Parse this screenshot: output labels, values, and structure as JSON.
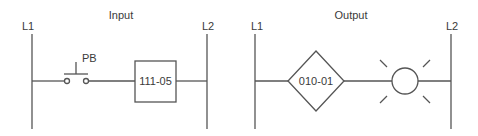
{
  "diagram": {
    "type": "ladder-logic",
    "colors": {
      "line": "#555555",
      "text": "#3a3a3a",
      "background": "#ffffff"
    },
    "input": {
      "title": "Input",
      "left_rail_label": "L1",
      "right_rail_label": "L2",
      "pushbutton": {
        "label": "PB",
        "type": "normally-open-pushbutton"
      },
      "box": {
        "label": "111-05",
        "type": "input-address-box"
      }
    },
    "output": {
      "title": "Output",
      "left_rail_label": "L1",
      "right_rail_label": "L2",
      "diamond": {
        "label": "010-01",
        "type": "output-address-diamond"
      },
      "lamp": {
        "type": "pilot-light",
        "icon": "lamp-icon"
      }
    }
  }
}
